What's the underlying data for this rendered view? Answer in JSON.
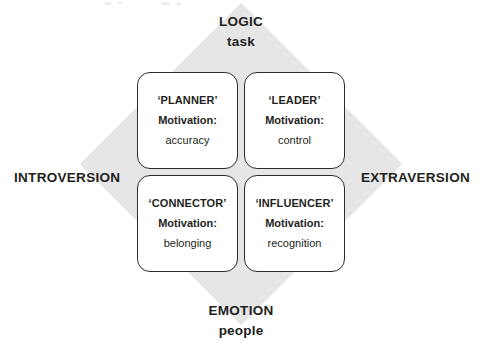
{
  "diagram": {
    "colors": {
      "diamond_gray": "#e6e6e6",
      "card_border": "#2b2b2b",
      "text": "#231f20",
      "background": "#ffffff"
    },
    "axes": {
      "vertical": {
        "top": {
          "primary": "LOGIC",
          "secondary": "task"
        },
        "bottom": {
          "primary": "EMOTION",
          "secondary": "people"
        }
      },
      "horizontal": {
        "left": {
          "primary": "INTROVERSION"
        },
        "right": {
          "primary": "EXTRAVERSION"
        }
      }
    },
    "quadrants": [
      {
        "id": "planner",
        "position": "top-left",
        "title": "‘PLANNER’",
        "motivation_label": "Motivation:",
        "motivation_value": "accuracy"
      },
      {
        "id": "leader",
        "position": "top-right",
        "title": "‘LEADER’",
        "motivation_label": "Motivation:",
        "motivation_value": "control"
      },
      {
        "id": "connector",
        "position": "bottom-left",
        "title": "‘CONNECTOR’",
        "motivation_label": "Motivation:",
        "motivation_value": "belonging"
      },
      {
        "id": "influencer",
        "position": "bottom-right",
        "title": "‘INFLUENCER’",
        "motivation_label": "Motivation:",
        "motivation_value": "recognition"
      }
    ]
  }
}
